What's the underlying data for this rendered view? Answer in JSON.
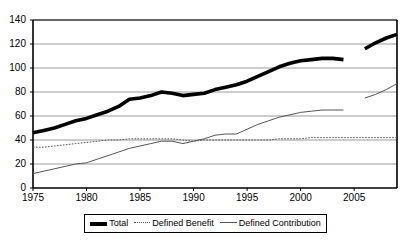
{
  "chart_data": {
    "type": "line",
    "title": "",
    "subtitle": "",
    "xlabel": "",
    "ylabel": "",
    "xlim": [
      1975,
      2009
    ],
    "ylim": [
      0,
      140
    ],
    "ytick_labels": [
      "140",
      "120",
      "100",
      "80",
      "60",
      "40",
      "20",
      "0"
    ],
    "ytick_values": [
      140,
      120,
      100,
      80,
      60,
      40,
      20,
      0
    ],
    "xtick_labels": [
      "1975",
      "1980",
      "1985",
      "1990",
      "1995",
      "2000",
      "2005"
    ],
    "xtick_values": [
      1975,
      1980,
      1985,
      1990,
      1995,
      2000,
      2005
    ],
    "grid": "horizontal",
    "legend_position": "bottom",
    "x": [
      1975,
      1976,
      1977,
      1978,
      1979,
      1980,
      1981,
      1982,
      1983,
      1984,
      1985,
      1986,
      1987,
      1988,
      1989,
      1990,
      1991,
      1992,
      1993,
      1994,
      1995,
      1996,
      1997,
      1998,
      1999,
      2000,
      2001,
      2002,
      2003,
      2004,
      2005,
      2006,
      2007,
      2008,
      2009
    ],
    "series": [
      {
        "name": "Total",
        "style": "thick-solid",
        "color": "#000000",
        "values": [
          46,
          48,
          50,
          53,
          56,
          58,
          61,
          64,
          68,
          74,
          75,
          77,
          80,
          79,
          77,
          78,
          79,
          82,
          84,
          86,
          89,
          93,
          97,
          101,
          104,
          106,
          107,
          108,
          108,
          107,
          null,
          116,
          121,
          125,
          128
        ],
        "break_after_year": 2004,
        "resume_year": 2006,
        "resume_value": 116
      },
      {
        "name": "Defined Benefit",
        "style": "dotted",
        "color": "#555555",
        "values": [
          34,
          34,
          35,
          36,
          37,
          38,
          39,
          40,
          40,
          41,
          41,
          41,
          41,
          41,
          40,
          39,
          40,
          40,
          40,
          40,
          40,
          40,
          40,
          41,
          41,
          41,
          42,
          42,
          42,
          42,
          42,
          42,
          42,
          42,
          42
        ]
      },
      {
        "name": "Defined Contribution",
        "style": "thin-solid",
        "color": "#555555",
        "values": [
          12,
          14,
          16,
          18,
          20,
          21,
          24,
          27,
          30,
          33,
          35,
          37,
          39,
          39,
          37,
          39,
          41,
          44,
          45,
          45,
          49,
          53,
          56,
          59,
          61,
          63,
          64,
          65,
          65,
          65,
          null,
          75,
          78,
          82,
          87
        ],
        "break_after_year": 2004,
        "resume_year": 2006,
        "resume_value": 75
      }
    ]
  },
  "legend": {
    "items": [
      {
        "label": "Total",
        "swatch": "thick-solid-swatch"
      },
      {
        "label": "Defined Benefit",
        "swatch": "dotted-swatch"
      },
      {
        "label": "Defined Contribution",
        "swatch": "thin-solid-swatch"
      }
    ]
  },
  "colors": {
    "total": "#000000",
    "defined_benefit": "#555555",
    "defined_contribution": "#555555",
    "grid": "#808080",
    "axis": "#000000",
    "background": "#ffffff"
  }
}
